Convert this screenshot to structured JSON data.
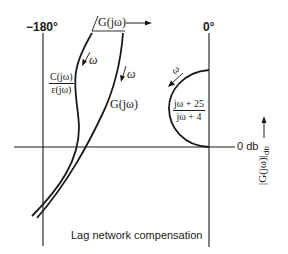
{
  "figure": {
    "caption": "Lag network compensation",
    "axes": {
      "phase_left_label": "−180°",
      "phase_right_label": "0°",
      "zero_db_label": "0 db",
      "phase_axis_label": "G(jω)",
      "magnitude_axis_label": "|G(jω)|",
      "magnitude_axis_subscript": "db"
    },
    "curves": {
      "closed_loop": {
        "numerator": "C(jω)",
        "denominator": "ε(jω)",
        "direction_label": "ω"
      },
      "open_loop": {
        "label": "G(jω)",
        "direction_label": "ω"
      },
      "lag_network": {
        "numerator": "jω + 25",
        "denominator": "jω + 4",
        "direction_label": "ω"
      }
    }
  },
  "colors": {
    "ink": "#1a1a1a",
    "background": "#ffffff"
  }
}
